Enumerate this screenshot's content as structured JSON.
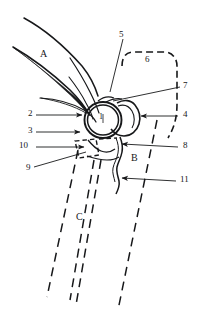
{
  "figure": {
    "background_color": "#ffffff",
    "line_color": "#17181a",
    "width": 197,
    "height": 315
  },
  "region_labels": [
    {
      "id": "region-a",
      "text": "A",
      "x": 40,
      "y": 53
    },
    {
      "id": "region-b",
      "text": "B",
      "x": 131,
      "y": 157
    },
    {
      "id": "region-c",
      "text": "C",
      "x": 76,
      "y": 216
    }
  ],
  "inner_labels": [
    {
      "id": "callout-1",
      "text": "1",
      "x": 101,
      "y": 117
    }
  ],
  "callouts": [
    {
      "id": "callout-2",
      "text": "2",
      "x": 29,
      "y": 112,
      "side": "left"
    },
    {
      "id": "callout-3",
      "text": "3",
      "x": 29,
      "y": 129,
      "side": "left"
    },
    {
      "id": "callout-5",
      "text": "5",
      "x": 119,
      "y": 34,
      "side": "top"
    },
    {
      "id": "callout-6",
      "text": "6",
      "x": 145,
      "y": 58,
      "side": "top"
    },
    {
      "id": "callout-7",
      "text": "7",
      "x": 183,
      "y": 84,
      "side": "right"
    },
    {
      "id": "callout-4",
      "text": "4",
      "x": 183,
      "y": 113,
      "side": "right"
    },
    {
      "id": "callout-8",
      "text": "8",
      "x": 183,
      "y": 144,
      "side": "right"
    },
    {
      "id": "callout-9",
      "text": "9",
      "x": 26,
      "y": 166,
      "side": "left"
    },
    {
      "id": "callout-10",
      "text": "10",
      "x": 22,
      "y": 144,
      "side": "left"
    },
    {
      "id": "callout-11",
      "text": "11",
      "x": 180,
      "y": 178,
      "side": "right"
    }
  ]
}
